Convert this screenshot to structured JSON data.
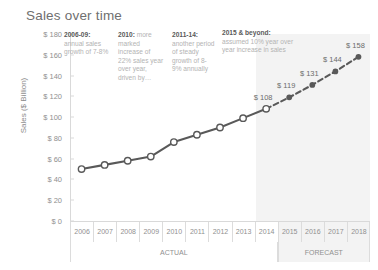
{
  "chart_data": {
    "type": "line",
    "title": "Sales over time",
    "xlabel": "",
    "ylabel": "Sales ($ Billion)",
    "ylim": [
      0,
      180
    ],
    "ytick_step": 20,
    "yticks": [
      "$ 180",
      "$ 160",
      "$ 140",
      "$ 120",
      "$ 100",
      "$ 80",
      "$ 60",
      "$ 40",
      "$ 20",
      "$ 0"
    ],
    "ytick_values": [
      180,
      160,
      140,
      120,
      100,
      80,
      60,
      40,
      20,
      0
    ],
    "categories": [
      "2006",
      "2007",
      "2008",
      "2009",
      "2010",
      "2011",
      "2012",
      "2013",
      "2014",
      "2015",
      "2016",
      "2017",
      "2018"
    ],
    "grid": false,
    "legend": "none",
    "series": [
      {
        "name": "Actual",
        "style": "solid",
        "marker": "hollow-circle",
        "color": "#595959",
        "x": [
          "2006",
          "2007",
          "2008",
          "2009",
          "2010",
          "2011",
          "2012",
          "2013",
          "2014"
        ],
        "values": [
          50,
          54,
          58,
          62,
          76,
          83,
          90,
          99,
          108
        ]
      },
      {
        "name": "Forecast",
        "style": "dashed",
        "marker": "filled-circle",
        "color": "#595959",
        "x": [
          "2014",
          "2015",
          "2016",
          "2017",
          "2018"
        ],
        "values": [
          108,
          119,
          131,
          144,
          158
        ]
      }
    ],
    "data_labels": [
      {
        "x": "2014",
        "value": 108,
        "text": "$ 108"
      },
      {
        "x": "2015",
        "value": 119,
        "text": "$ 119"
      },
      {
        "x": "2016",
        "value": 131,
        "text": "$ 131"
      },
      {
        "x": "2017",
        "value": 144,
        "text": "$ 144"
      },
      {
        "x": "2018",
        "value": 158,
        "text": "$ 158"
      }
    ],
    "x_groups": [
      {
        "label": "ACTUAL",
        "from": "2006",
        "to": "2014",
        "shaded": false
      },
      {
        "label": "FORECAST",
        "from": "2015",
        "to": "2018",
        "shaded": true
      }
    ],
    "annotations": [
      {
        "lead": "2006-09:",
        "body": "annual sales growth of 7-8%"
      },
      {
        "lead": "2010:",
        "body": " more marked increase of 22% sales year over year, driven by…"
      },
      {
        "lead": "2011-14:",
        "body": "another period of steady growth of 8-9% annually"
      },
      {
        "lead": "2015 & beyond:",
        "body": "assumed 10% year over year increase in sales"
      }
    ],
    "colors": {
      "line": "#595959",
      "text_muted": "#b3b3b3",
      "text_strong": "#595959",
      "axis": "#d9d9d9",
      "forecast_band": "#f3f3f3",
      "background": "#ffffff"
    }
  }
}
